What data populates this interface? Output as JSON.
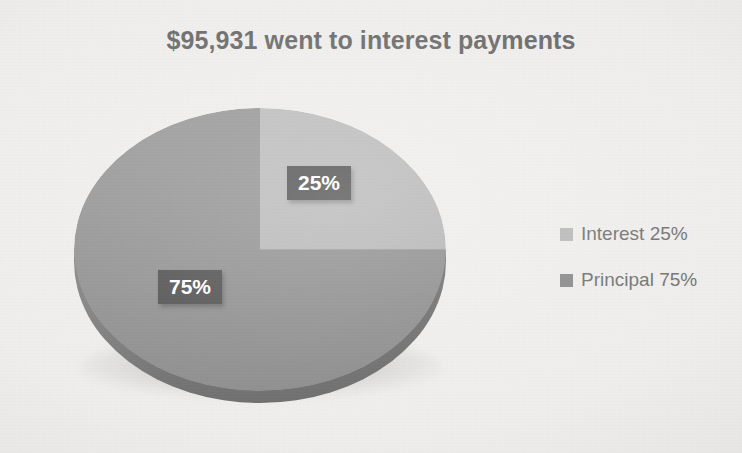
{
  "chart": {
    "title": "$95,931 went to interest payments"
  },
  "legend": {
    "items": [
      {
        "label": "Interest 25%",
        "color": "#b1b1b1",
        "swatch_name": "legend-swatch-interest"
      },
      {
        "label": "Principal 75%",
        "color": "#7e7e7e",
        "swatch_name": "legend-swatch-principal"
      }
    ]
  },
  "labels": {
    "interest": "25%",
    "principal": "75%"
  },
  "colors": {
    "background": "#edecea",
    "title_text": "#5a5a5a",
    "legend_text": "#636363",
    "interest_slice": "#b1b1b1",
    "principal_slice": "#858585",
    "pie_side_wall": "#696969",
    "data_label_bg": "#3f3f3f",
    "data_label_text": "#ffffff"
  },
  "chart_data": {
    "type": "pie",
    "title": "$95,931 went to interest payments",
    "categories": [
      "Interest",
      "Principal"
    ],
    "values": [
      25,
      75
    ],
    "value_unit": "percent",
    "data_labels": [
      "25%",
      "75%"
    ],
    "legend_entries": [
      "Interest 25%",
      "Principal 75%"
    ],
    "legend_position": "right",
    "three_d": true,
    "start_angle_deg": 0,
    "direction": "clockwise",
    "slice_colors": [
      "#b1b1b1",
      "#858585"
    ],
    "grid": false,
    "xlabel": "",
    "ylabel": ""
  }
}
